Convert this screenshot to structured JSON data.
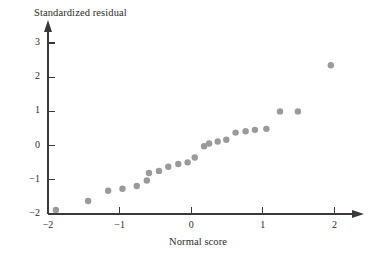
{
  "chart_data": {
    "type": "scatter",
    "title": "",
    "xlabel": "Normal score",
    "ylabel": "Standardized residual",
    "xlim": [
      -2.2,
      2.25
    ],
    "ylim": [
      -2.05,
      3.3
    ],
    "xticks": [
      -2,
      -1,
      0,
      1,
      2
    ],
    "yticks": [
      -2,
      -1,
      0,
      1,
      2,
      3
    ],
    "xtick_labels": [
      "−2",
      "−1",
      "0",
      "1",
      "2"
    ],
    "ytick_labels": [
      "−2",
      "−1",
      "0",
      "1",
      "2",
      "3"
    ],
    "grid": false,
    "legend": null,
    "marker": {
      "shape": "circle",
      "size": 3.2,
      "color": "#9a9a9c"
    },
    "axis_color": "#3a3a3a",
    "points": [
      {
        "x": -1.89,
        "y": -1.88
      },
      {
        "x": -1.44,
        "y": -1.62
      },
      {
        "x": -1.16,
        "y": -1.32
      },
      {
        "x": -0.96,
        "y": -1.26
      },
      {
        "x": -0.76,
        "y": -1.18
      },
      {
        "x": -0.62,
        "y": -1.02
      },
      {
        "x": -0.59,
        "y": -0.8
      },
      {
        "x": -0.45,
        "y": -0.74
      },
      {
        "x": -0.32,
        "y": -0.62
      },
      {
        "x": -0.18,
        "y": -0.54
      },
      {
        "x": -0.05,
        "y": -0.49
      },
      {
        "x": 0.05,
        "y": -0.35
      },
      {
        "x": 0.18,
        "y": -0.02
      },
      {
        "x": 0.25,
        "y": 0.06
      },
      {
        "x": 0.37,
        "y": 0.12
      },
      {
        "x": 0.49,
        "y": 0.17
      },
      {
        "x": 0.62,
        "y": 0.38
      },
      {
        "x": 0.76,
        "y": 0.42
      },
      {
        "x": 0.89,
        "y": 0.46
      },
      {
        "x": 1.05,
        "y": 0.49
      },
      {
        "x": 1.24,
        "y": 1.0
      },
      {
        "x": 1.49,
        "y": 1.0
      },
      {
        "x": 1.95,
        "y": 2.35
      }
    ]
  },
  "labels": {
    "y_axis_title": "Standardized residual",
    "x_axis_title": "Normal score"
  }
}
